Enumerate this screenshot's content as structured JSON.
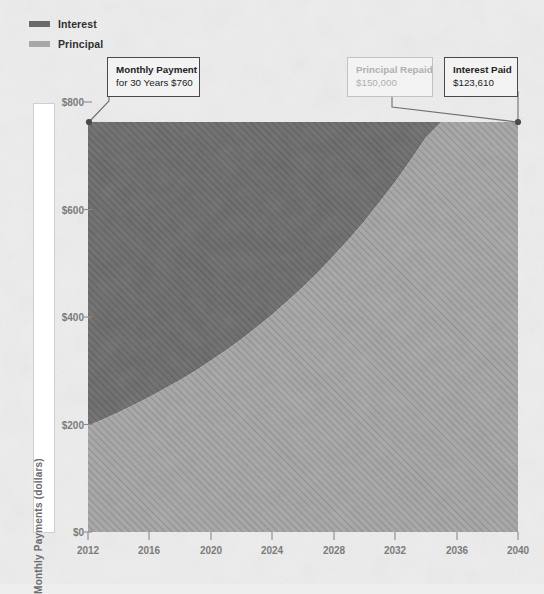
{
  "legend": {
    "items": [
      {
        "label": "Interest",
        "color": "#6a6a6a"
      },
      {
        "label": "Principal",
        "color": "#a8a8a8"
      }
    ]
  },
  "annotations": [
    {
      "name": "monthly-payment",
      "line1": "Monthly Payment",
      "line2": "for 30 Years $760",
      "style": "dark"
    },
    {
      "name": "principal-repaid",
      "line1": "Principal Repaid",
      "line2": "$150,000",
      "style": "muted"
    },
    {
      "name": "interest-paid",
      "line1": "Interest Paid",
      "line2": "$123,610",
      "style": "dark"
    }
  ],
  "axes": {
    "y_label": "Monthly Payments (dollars)",
    "y_ticks": [
      "$0",
      "$200",
      "$400",
      "$600",
      "$800"
    ],
    "x_ticks": [
      "2012",
      "2016",
      "2020",
      "2024",
      "2028",
      "2032",
      "2036",
      "2040"
    ]
  },
  "colors": {
    "interest": "#6a6a6a",
    "principal": "#a8a8a8",
    "background": "#eeeeee",
    "axis_text": "#7b7b7b",
    "callout_border": "#4a4a4a",
    "callout_muted_border": "#c2c2c2",
    "callout_muted_text": "#b0b0b0"
  },
  "chart_data": {
    "type": "area",
    "title": "",
    "subtitle": "",
    "xlabel": "",
    "ylabel": "Monthly Payments (dollars)",
    "stacked": true,
    "grid": false,
    "legend_position": "top-left",
    "xlim": [
      2012,
      2040
    ],
    "ylim": [
      0,
      800
    ],
    "xticks": [
      2012,
      2016,
      2020,
      2024,
      2028,
      2032,
      2036,
      2040
    ],
    "yticks": [
      0,
      200,
      400,
      600,
      800
    ],
    "ytick_labels": [
      "$0",
      "$200",
      "$400",
      "$600",
      "$800"
    ],
    "total_monthly_payment": 760,
    "x": [
      2012,
      2013,
      2014,
      2015,
      2016,
      2017,
      2018,
      2019,
      2020,
      2021,
      2022,
      2023,
      2024,
      2025,
      2026,
      2027,
      2028,
      2029,
      2030,
      2031,
      2032,
      2033,
      2034,
      2035,
      2036,
      2037,
      2038,
      2039,
      2040
    ],
    "series": [
      {
        "name": "Principal",
        "color": "#a8a8a8",
        "values": [
          197,
          209,
          222,
          236,
          250,
          266,
          282,
          299,
          318,
          337,
          358,
          380,
          403,
          428,
          454,
          482,
          512,
          543,
          576,
          612,
          649,
          689,
          731,
          776,
          824,
          874,
          928,
          985,
          1045
        ]
      },
      {
        "name": "Interest",
        "color": "#6a6a6a",
        "values": [
          563,
          551,
          538,
          524,
          510,
          494,
          478,
          461,
          442,
          423,
          402,
          380,
          357,
          332,
          306,
          278,
          248,
          217,
          184,
          148,
          111,
          71,
          29,
          -16,
          -64,
          -114,
          -168,
          -225,
          -285
        ]
      }
    ],
    "principal_boundary_note": "Boundary between Principal (lower) and Interest (upper) bands; total stays flat at $760/month",
    "annotations": [
      {
        "text": "Monthly Payment for 30 Years $760",
        "x": 2012,
        "y": 760
      },
      {
        "text": "Principal Repaid $150,000",
        "x": 2040,
        "y": 760
      },
      {
        "text": "Interest Paid $123,610",
        "x": 2040,
        "y": 760
      }
    ]
  }
}
